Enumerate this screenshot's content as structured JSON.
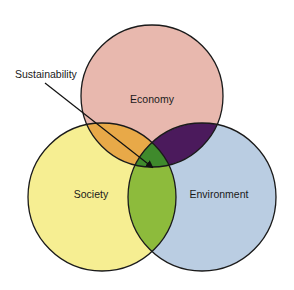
{
  "diagram": {
    "type": "venn",
    "sets": [
      {
        "id": "economy",
        "label": "Economy",
        "color": "#e8b8ae"
      },
      {
        "id": "society",
        "label": "Society",
        "color": "#f6ee92"
      },
      {
        "id": "environment",
        "label": "Environment",
        "color": "#bacde2"
      }
    ],
    "intersections": [
      {
        "sets": [
          "economy",
          "society"
        ],
        "color": "#e8a948"
      },
      {
        "sets": [
          "economy",
          "environment"
        ],
        "color": "#4b1a5c"
      },
      {
        "sets": [
          "society",
          "environment"
        ],
        "color": "#8dbb3c"
      },
      {
        "sets": [
          "economy",
          "society",
          "environment"
        ],
        "color": "#3f8a2c"
      }
    ],
    "callout": {
      "label": "Sustainability",
      "points_to": [
        "economy",
        "society",
        "environment"
      ]
    },
    "stroke_color": "#1a1a1a"
  }
}
